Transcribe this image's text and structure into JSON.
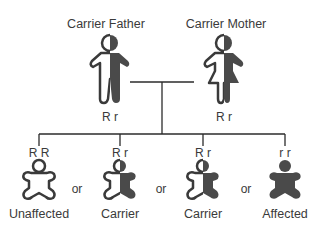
{
  "parents": {
    "father": {
      "label": "Carrier Father",
      "genotype": "R r",
      "status": "carrier"
    },
    "mother": {
      "label": "Carrier Mother",
      "genotype": "R r",
      "status": "carrier"
    }
  },
  "children": [
    {
      "genotype": "R R",
      "label": "Unaffected",
      "status": "unaffected"
    },
    {
      "genotype": "R r",
      "label": "Carrier",
      "status": "carrier"
    },
    {
      "genotype": "R r",
      "label": "Carrier",
      "status": "carrier"
    },
    {
      "genotype": "r r",
      "label": "Affected",
      "status": "affected"
    }
  ],
  "separators": [
    "or",
    "or",
    "or"
  ],
  "colors": {
    "fill": "#4a4a4a",
    "line": "#2b2b2b",
    "background": "#ffffff"
  }
}
